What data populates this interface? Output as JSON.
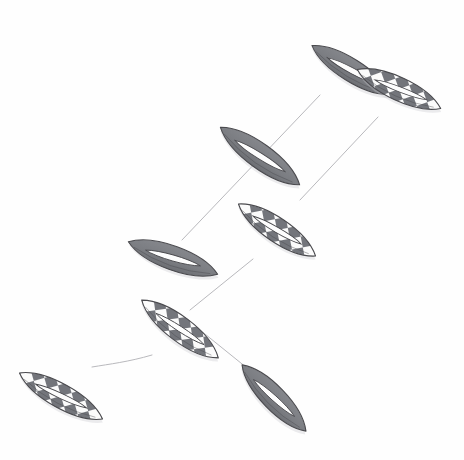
{
  "artwork": {
    "title": "Chain of stylized boat hulls",
    "medium": "pencil-and-gray-wash line drawing",
    "background_color": "#fefefe",
    "canvas": {
      "width": 464,
      "height": 460
    }
  },
  "palette": {
    "background": "#fefefe",
    "solid_fill": "#7d7f84",
    "solid_fill_dark": "#6e7075",
    "checker_dark": "#73757b",
    "checker_light": "#fbfbfb",
    "outline": "#4a4a4e",
    "inner_sliver": "#fdfdfd",
    "thread": "#b9b9bd",
    "shadow": "#c9c9cd"
  },
  "render": {
    "hull_outline_width": 1.1,
    "thread_width": 1.0,
    "checker_cell": 11
  },
  "hulls": [
    {
      "id": "hull-1",
      "name": "upper-right-solid-hull",
      "style": "solid",
      "center_x": 351,
      "center_y": 70,
      "length": 92,
      "width": 30,
      "rotation": 32,
      "sliver_length_ratio": 0.62,
      "sliver_width_ratio": 0.26,
      "sliver_offset": 0.02
    },
    {
      "id": "hull-2",
      "name": "top-right-checkered-hull",
      "style": "checkered",
      "center_x": 399,
      "center_y": 89,
      "length": 92,
      "width": 31,
      "rotation": 25,
      "sliver_length_ratio": 0.6,
      "sliver_width_ratio": 0.22,
      "sliver_offset": 0.02
    },
    {
      "id": "hull-3",
      "name": "upper-middle-solid-hull",
      "style": "solid",
      "center_x": 260,
      "center_y": 156,
      "length": 98,
      "width": 33,
      "rotation": 36,
      "sliver_length_ratio": 0.6,
      "sliver_width_ratio": 0.25,
      "sliver_offset": 0.0
    },
    {
      "id": "hull-4",
      "name": "middle-right-checkered-hull",
      "style": "checkered",
      "center_x": 277,
      "center_y": 230,
      "length": 93,
      "width": 32,
      "rotation": 34,
      "sliver_length_ratio": 0.6,
      "sliver_width_ratio": 0.22,
      "sliver_offset": 0.0
    },
    {
      "id": "hull-5",
      "name": "middle-left-solid-hull",
      "style": "solid",
      "center_x": 173,
      "center_y": 258,
      "length": 95,
      "width": 32,
      "rotation": 20,
      "sliver_length_ratio": 0.6,
      "sliver_width_ratio": 0.25,
      "sliver_offset": 0.0
    },
    {
      "id": "hull-6",
      "name": "center-checkered-hull",
      "style": "checkered",
      "center_x": 180,
      "center_y": 329,
      "length": 96,
      "width": 33,
      "rotation": 37,
      "sliver_length_ratio": 0.6,
      "sliver_width_ratio": 0.22,
      "sliver_offset": 0.0
    },
    {
      "id": "hull-7",
      "name": "lower-left-checkered-hull",
      "style": "checkered",
      "center_x": 61,
      "center_y": 396,
      "length": 95,
      "width": 32,
      "rotation": 29,
      "sliver_length_ratio": 0.6,
      "sliver_width_ratio": 0.22,
      "sliver_offset": 0.0
    },
    {
      "id": "hull-8",
      "name": "lower-right-solid-hull",
      "style": "solid",
      "center_x": 274,
      "center_y": 398,
      "length": 92,
      "width": 31,
      "rotation": 46,
      "sliver_length_ratio": 0.6,
      "sliver_width_ratio": 0.24,
      "sliver_offset": 0.0
    }
  ],
  "threads": [
    {
      "id": "thread-1",
      "name": "thread-solid-chain-upper",
      "path": "M 320 95 L 182 240"
    },
    {
      "id": "thread-2",
      "name": "thread-checkered-chain-upper",
      "path": "M 378 117 L 300 200"
    },
    {
      "id": "thread-3",
      "name": "thread-checkered-chain-lower",
      "path": "M 253 259 L 190 310"
    },
    {
      "id": "thread-4",
      "name": "thread-center-to-lower-right",
      "path": "M 200 330 L 252 372"
    },
    {
      "id": "thread-5",
      "name": "thread-center-to-lower-left-curve",
      "path": "M 152 355 C 128 362 110 364 92 367"
    }
  ]
}
